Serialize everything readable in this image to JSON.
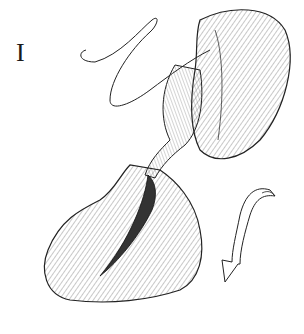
{
  "figure": {
    "panel_label": "I",
    "colors": {
      "line": "#222222",
      "shade": "#555555",
      "background": "#ffffff"
    },
    "elements": [
      "suture-thread",
      "organ-upper-lobe",
      "tubular-structure",
      "organ-lower-body",
      "incision-opening",
      "curved-arrow"
    ]
  }
}
